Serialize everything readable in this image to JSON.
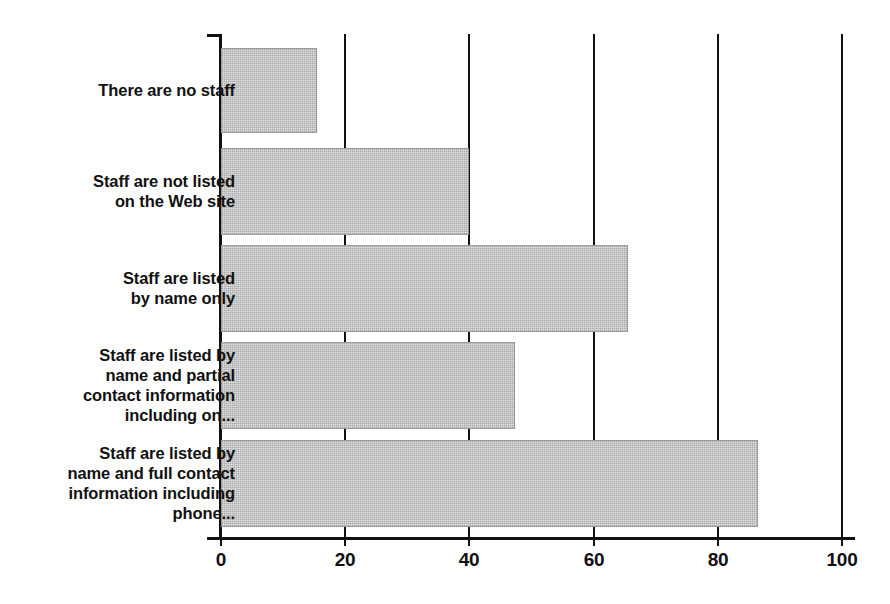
{
  "chart_data": {
    "type": "bar",
    "orientation": "horizontal",
    "title": "",
    "subtitle": "",
    "xlabel": "",
    "ylabel": "",
    "xlim": [
      0,
      100
    ],
    "xticks": [
      0,
      20,
      40,
      60,
      80,
      100
    ],
    "xtick_labels": [
      "0",
      "20",
      "40",
      "60",
      "80",
      "100"
    ],
    "grid": "vertical gridlines at each x tick",
    "legend": "none",
    "bar_color": "#a9a9a9",
    "axis_color": "#111111",
    "categories": [
      "There are no staff",
      "Staff are not listed\non the Web site",
      "Staff are listed\nby name only",
      "Staff are listed by\nname and partial\ncontact information\nincluding on...",
      "Staff are listed by\nname and full contact\ninformation including\nphone..."
    ],
    "values": [
      15.5,
      40,
      65.5,
      47.3,
      86.5
    ]
  },
  "axis": {
    "ticks": [
      {
        "value": 0,
        "label": "0"
      },
      {
        "value": 20,
        "label": "20"
      },
      {
        "value": 40,
        "label": "40"
      },
      {
        "value": 60,
        "label": "60"
      },
      {
        "value": 80,
        "label": "80"
      },
      {
        "value": 100,
        "label": "100"
      }
    ]
  },
  "bars": [
    {
      "label": "There are no staff",
      "value": 15.5,
      "top": 48,
      "height": 85
    },
    {
      "label": "Staff are not listed\non the Web site",
      "value": 40,
      "top": 148,
      "height": 87
    },
    {
      "label": "Staff are listed\nby name only",
      "value": 65.5,
      "top": 245,
      "height": 87
    },
    {
      "label": "Staff are listed by\nname and partial\ncontact information\nincluding on...",
      "value": 47.3,
      "top": 342,
      "height": 87
    },
    {
      "label": "Staff are listed by\nname and full contact\ninformation including\nphone...",
      "value": 86.5,
      "top": 440,
      "height": 87
    }
  ]
}
